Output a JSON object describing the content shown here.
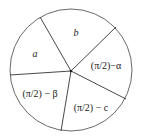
{
  "diagram": {
    "center": {
      "x": 71,
      "y": 71
    },
    "circle": {
      "cx": 71,
      "cy": 70,
      "r": 61
    },
    "colors": {
      "circle_stroke": "#6a6a6a",
      "line_stroke": "#333333",
      "text": "#222222",
      "background": "#ffffff"
    },
    "dividers": [
      {
        "name": "a-b",
        "x2": 40,
        "y2": 17
      },
      {
        "name": "b-alpha",
        "x2": 116,
        "y2": 27
      },
      {
        "name": "alpha-c",
        "x2": 126,
        "y2": 99
      },
      {
        "name": "c-beta",
        "x2": 61,
        "y2": 131
      },
      {
        "name": "beta-a",
        "x2": 10,
        "y2": 75
      }
    ],
    "segments": [
      {
        "id": "a",
        "label": "a",
        "x": 35,
        "y": 57,
        "italic": true
      },
      {
        "id": "b",
        "label": "b",
        "x": 76,
        "y": 36,
        "italic": true
      },
      {
        "id": "alpha",
        "label": "(π/2)−α",
        "x": 106,
        "y": 69,
        "italic": false
      },
      {
        "id": "beta",
        "label": "(π/2) − β",
        "x": 40,
        "y": 97,
        "italic": false
      },
      {
        "id": "c",
        "label": "(π/2) − c",
        "x": 91,
        "y": 111,
        "italic": false
      }
    ]
  }
}
